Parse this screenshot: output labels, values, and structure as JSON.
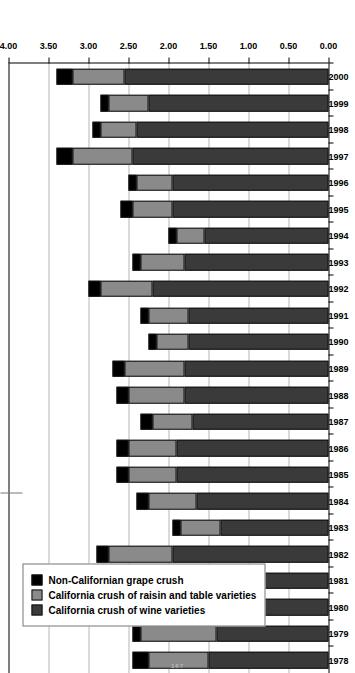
{
  "chart_data": {
    "type": "bar",
    "orientation": "horizontal-rotated",
    "title": "",
    "xlabel": "",
    "ylabel": "",
    "stacked": true,
    "grid": true,
    "value_axis": {
      "min": 0.0,
      "max": 4.0,
      "step": 0.5,
      "ticks": [
        "4.00",
        "3.50",
        "3.00",
        "2.50",
        "2.00",
        "1.50",
        "1.00",
        "0.50",
        "0.00"
      ],
      "tick_values": [
        4.0,
        3.5,
        3.0,
        2.5,
        2.0,
        1.5,
        1.0,
        0.5,
        0.0
      ],
      "direction": "decreasing-left-to-right"
    },
    "categories": [
      "1978",
      "1979",
      "1980",
      "1981",
      "1982",
      "1983",
      "1984",
      "1985",
      "1986",
      "1987",
      "1988",
      "1989",
      "1990",
      "1991",
      "1992",
      "1993",
      "1994",
      "1995",
      "1996",
      "1997",
      "1998",
      "1999",
      "2000"
    ],
    "series": [
      {
        "name": "California crush of wine varieties",
        "color": "#3a3a3a",
        "values": [
          1.5,
          1.4,
          1.55,
          1.4,
          1.95,
          1.35,
          1.65,
          1.9,
          1.9,
          1.7,
          1.8,
          1.8,
          1.75,
          1.75,
          2.2,
          1.8,
          1.55,
          1.95,
          1.95,
          2.45,
          2.4,
          2.25,
          2.55
        ]
      },
      {
        "name": "California crush of raisin and table varieties",
        "color": "#8a8a8a",
        "values": [
          0.75,
          0.95,
          1.0,
          0.75,
          0.8,
          0.5,
          0.6,
          0.6,
          0.6,
          0.5,
          0.7,
          0.75,
          0.4,
          0.5,
          0.65,
          0.55,
          0.35,
          0.5,
          0.45,
          0.75,
          0.45,
          0.5,
          0.65
        ]
      },
      {
        "name": "Non-Californian grape crush",
        "color": "#000000",
        "values": [
          0.2,
          0.1,
          0.15,
          0.1,
          0.15,
          0.1,
          0.15,
          0.15,
          0.15,
          0.15,
          0.15,
          0.15,
          0.1,
          0.1,
          0.15,
          0.1,
          0.1,
          0.15,
          0.1,
          0.2,
          0.1,
          0.1,
          0.2
        ]
      }
    ],
    "legend": {
      "position": "inside-left",
      "entries": [
        {
          "label": "Non-Californian grape crush",
          "color": "#000000"
        },
        {
          "label": "California crush of raisin and table varieties",
          "color": "#8a8a8a"
        },
        {
          "label": "California crush of wine varieties",
          "color": "#3a3a3a"
        }
      ]
    }
  },
  "page": {
    "number": "167"
  }
}
